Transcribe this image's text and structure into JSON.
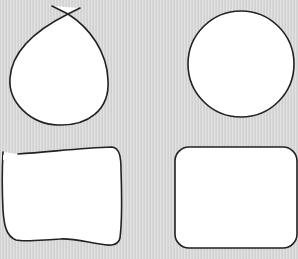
{
  "canvas": {
    "width": 298,
    "height": 259,
    "background_color": "#d9d9d9",
    "stroke_color": "#222222",
    "fill_color": "#ffffff"
  },
  "shapes": [
    {
      "name": "teardrop-loop",
      "description": "Loop shape with crossing tails at top"
    },
    {
      "name": "circle",
      "description": "Circle"
    },
    {
      "name": "wobbly-rectangle",
      "description": "Hand-drawn irregular rectangle with gap at top-left"
    },
    {
      "name": "rounded-rectangle",
      "description": "Rectangle with rounded corners"
    }
  ]
}
